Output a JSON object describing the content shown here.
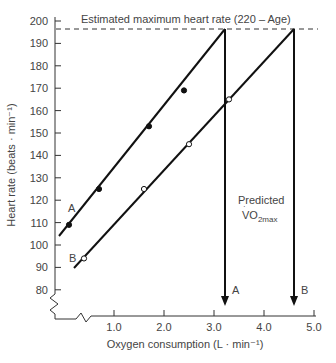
{
  "chart_data": {
    "type": "line",
    "title": "",
    "xlabel": "Oxygen consumption (L · min⁻¹)",
    "ylabel": "Heart rate (beats · min⁻¹)",
    "xlim": [
      0,
      5.0
    ],
    "ylim": [
      80,
      200
    ],
    "x_ticks": [
      "1.0",
      "2.0",
      "3.0",
      "4.0",
      "5.0"
    ],
    "y_ticks": [
      "80",
      "90",
      "100",
      "110",
      "120",
      "130",
      "140",
      "150",
      "160",
      "170",
      "180",
      "190",
      "200"
    ],
    "grid": false,
    "axis_break": true,
    "series": [
      {
        "name": "A",
        "marker": "filled-circle",
        "points": [
          [
            0.1,
            109
          ],
          [
            0.7,
            125
          ],
          [
            1.7,
            153
          ],
          [
            2.4,
            169
          ]
        ],
        "fit_line": {
          "from": [
            -0.1,
            104
          ],
          "to": [
            3.2,
            196.5
          ]
        },
        "predicted_vo2max": 3.2
      },
      {
        "name": "B",
        "marker": "open-circle",
        "points": [
          [
            0.4,
            94
          ],
          [
            1.6,
            125
          ],
          [
            2.5,
            145
          ],
          [
            3.3,
            165
          ]
        ],
        "fit_line": {
          "from": [
            0.2,
            90
          ],
          "to": [
            4.6,
            196.5
          ]
        },
        "predicted_vo2max": 4.6
      }
    ],
    "reference_line": {
      "y": 196.5,
      "style": "dashed",
      "label": "Estimated maximum heart rate (220 – Age)"
    },
    "annotations": [
      {
        "text": "Predicted",
        "x": 3.9,
        "y": 126
      },
      {
        "text": "VO2max",
        "x": 3.9,
        "y": 120
      },
      {
        "text": "A",
        "at": "arrow-A"
      },
      {
        "text": "B",
        "at": "arrow-B"
      }
    ]
  },
  "labels": {
    "ref_line": "Estimated maximum heart rate (220 – Age)",
    "xlabel": "Oxygen consumption (L · min⁻¹)",
    "ylabel": "Heart rate (beats · min⁻¹)",
    "predicted": "Predicted",
    "vo2_v": "V",
    "vo2_o": "O",
    "vo2_sub": "2max",
    "line_a": "A",
    "line_b": "B",
    "arrow_a": "A",
    "arrow_b": "B"
  }
}
